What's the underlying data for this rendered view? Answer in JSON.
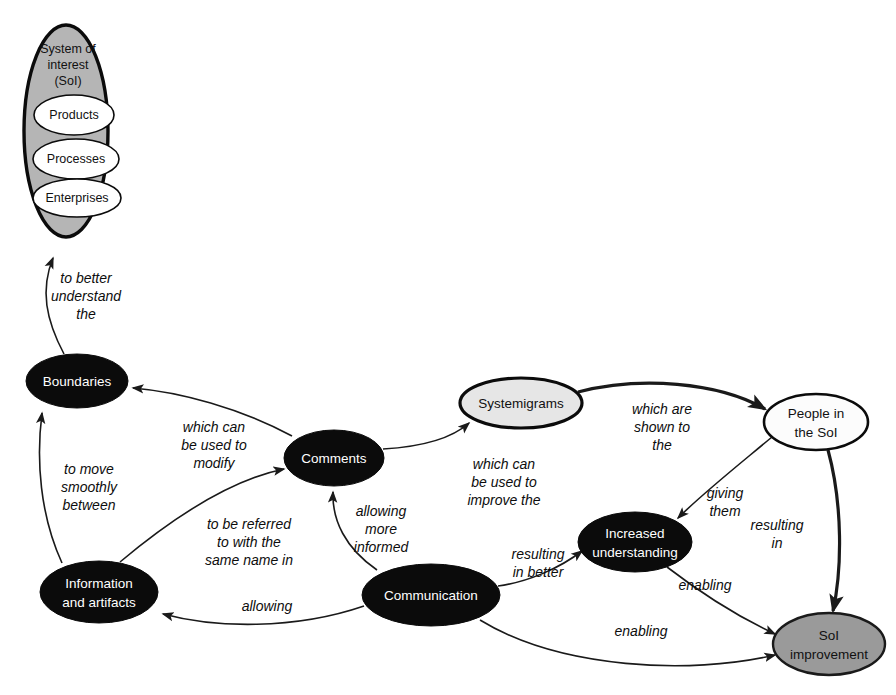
{
  "diagram": {
    "background_color": "#ffffff",
    "nodes": [
      {
        "id": "soi",
        "label": "System of\ninterest\n(SoI)",
        "label_lines": [
          "System of",
          "interest",
          "(SoI)"
        ],
        "shape": "ellipse",
        "fill": "#b5b5b5",
        "text_color": "#111111",
        "cx": 66,
        "cy": 131,
        "rx": 42,
        "ry": 106,
        "contains": [
          {
            "id": "products",
            "label": "Products",
            "cx": 74,
            "cy": 115,
            "rx": 40,
            "ry": 20,
            "fill": "#ffffff"
          },
          {
            "id": "processes",
            "label": "Processes",
            "cx": 76,
            "cy": 159,
            "rx": 43,
            "ry": 20,
            "fill": "#ffffff"
          },
          {
            "id": "enterprises",
            "label": "Enterprises",
            "cx": 77,
            "cy": 198,
            "rx": 44,
            "ry": 19,
            "fill": "#ffffff"
          }
        ]
      },
      {
        "id": "boundaries",
        "label": "Boundaries",
        "label_lines": [
          "Boundaries"
        ],
        "shape": "ellipse",
        "fill": "#0b0b0b",
        "text_color": "#ffffff",
        "cx": 77,
        "cy": 381,
        "rx": 51,
        "ry": 27
      },
      {
        "id": "information",
        "label": "Information and artifacts",
        "label_lines": [
          "Information",
          "and artifacts"
        ],
        "shape": "ellipse",
        "fill": "#0b0b0b",
        "text_color": "#ffffff",
        "cx": 99,
        "cy": 592,
        "rx": 59,
        "ry": 31
      },
      {
        "id": "comments",
        "label": "Comments",
        "label_lines": [
          "Comments"
        ],
        "shape": "ellipse",
        "fill": "#0b0b0b",
        "text_color": "#ffffff",
        "cx": 334,
        "cy": 458,
        "rx": 50,
        "ry": 28
      },
      {
        "id": "communication",
        "label": "Communication",
        "label_lines": [
          "Communication"
        ],
        "shape": "ellipse",
        "fill": "#0b0b0b",
        "text_color": "#ffffff",
        "cx": 431,
        "cy": 595,
        "rx": 69,
        "ry": 31
      },
      {
        "id": "systemigrams",
        "label": "Systemigrams",
        "label_lines": [
          "Systemigrams"
        ],
        "shape": "ellipse",
        "fill": "#e6e6e6",
        "text_color": "#111111",
        "cx": 521,
        "cy": 403,
        "rx": 61,
        "ry": 25
      },
      {
        "id": "people",
        "label": "People in the SoI",
        "label_lines": [
          "People in",
          "the SoI"
        ],
        "shape": "ellipse",
        "fill": "#fcfcfc",
        "text_color": "#111111",
        "cx": 816,
        "cy": 422,
        "rx": 52,
        "ry": 28
      },
      {
        "id": "increased",
        "label": "Increased understanding",
        "label_lines": [
          "Increased",
          "understanding"
        ],
        "shape": "ellipse",
        "fill": "#0b0b0b",
        "text_color": "#ffffff",
        "cx": 635,
        "cy": 542,
        "rx": 57,
        "ry": 30
      },
      {
        "id": "improvement",
        "label": "SoI improvement",
        "label_lines": [
          "SoI",
          "improvement"
        ],
        "shape": "ellipse",
        "fill": "#9a9a9a",
        "text_color": "#111111",
        "cx": 829,
        "cy": 644,
        "rx": 56,
        "ry": 31
      }
    ],
    "edges": [
      {
        "id": "boundaries-to-soi",
        "from": "boundaries",
        "to": "soi",
        "label": "to better understand the",
        "label_lines": [
          "to better",
          "understand",
          "the"
        ],
        "label_x": 86,
        "label_y": 296,
        "weight": "thin"
      },
      {
        "id": "information-to-boundaries",
        "from": "information",
        "to": "boundaries",
        "label": "to move smoothly between",
        "label_lines": [
          "to move",
          "smoothly",
          "between"
        ],
        "label_x": 89,
        "label_y": 487,
        "weight": "thin"
      },
      {
        "id": "comments-to-boundaries",
        "from": "comments",
        "to": "boundaries",
        "label": "which can be used to modify",
        "label_lines": [
          "which can",
          "be used to",
          "modify"
        ],
        "label_x": 214,
        "label_y": 445,
        "weight": "thin"
      },
      {
        "id": "information-to-comments",
        "from": "information",
        "to": "comments",
        "label": "to be referred to with the same name in",
        "label_lines": [
          "to be referred",
          "to with the",
          "same name in"
        ],
        "label_x": 249,
        "label_y": 542,
        "weight": "thin"
      },
      {
        "id": "communication-to-comments",
        "from": "communication",
        "to": "comments",
        "label": "allowing more informed",
        "label_lines": [
          "allowing",
          "more",
          "informed"
        ],
        "label_x": 381,
        "label_y": 529,
        "weight": "thin"
      },
      {
        "id": "comments-to-systemigrams",
        "from": "comments",
        "to": "systemigrams",
        "label": "which can be used to improve the",
        "label_lines": [
          "which can",
          "be used to",
          "improve the"
        ],
        "label_x": 504,
        "label_y": 482,
        "weight": "thin"
      },
      {
        "id": "systemigrams-to-people",
        "from": "systemigrams",
        "to": "people",
        "label": "which are shown to the",
        "label_lines": [
          "which are",
          "shown to",
          "the"
        ],
        "label_x": 662,
        "label_y": 427,
        "weight": "thick"
      },
      {
        "id": "people-to-increased",
        "from": "people",
        "to": "increased",
        "label": "giving them",
        "label_lines": [
          "giving",
          "them"
        ],
        "label_x": 725,
        "label_y": 502,
        "weight": "thin"
      },
      {
        "id": "people-to-improvement",
        "from": "people",
        "to": "improvement",
        "label": "resulting in",
        "label_lines": [
          "resulting",
          "in"
        ],
        "label_x": 777,
        "label_y": 534,
        "weight": "thick"
      },
      {
        "id": "communication-to-increased",
        "from": "communication",
        "to": "increased",
        "label": "resulting in better",
        "label_lines": [
          "resulting",
          "in better"
        ],
        "label_x": 538,
        "label_y": 563,
        "weight": "thin"
      },
      {
        "id": "increased-to-improvement",
        "from": "increased",
        "to": "improvement",
        "label": "enabling",
        "label_lines": [
          "enabling"
        ],
        "label_x": 705,
        "label_y": 586,
        "weight": "thin"
      },
      {
        "id": "communication-to-information",
        "from": "communication",
        "to": "information",
        "label": "allowing",
        "label_lines": [
          "allowing"
        ],
        "label_x": 267,
        "label_y": 607,
        "weight": "thin"
      },
      {
        "id": "communication-to-improvement",
        "from": "communication",
        "to": "improvement",
        "label": "enabling",
        "label_lines": [
          "enabling"
        ],
        "label_x": 641,
        "label_y": 632,
        "weight": "thin"
      }
    ]
  }
}
